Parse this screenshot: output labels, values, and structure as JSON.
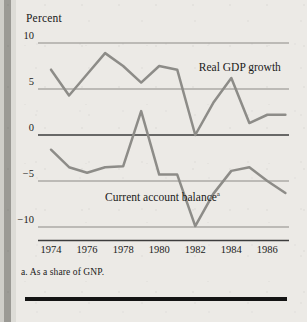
{
  "page": {
    "axis_unit_label": "Percent",
    "footnote": "a. As a share of GNP.",
    "bottom_rule_name": "bottom-rule"
  },
  "colors": {
    "background": "#eceae6",
    "gutter": "#9b9a95",
    "gridline": "#8b8a86",
    "zero_line": "#3c3c3c",
    "gdp_line": "#8d8c88",
    "current_account_line": "#8d8c88",
    "text": "#1a1a1a",
    "rule": "#141414"
  },
  "labels": {
    "gdp": "Real GDP growth",
    "current_account": "Current account balance",
    "current_account_superscript": "a"
  },
  "chart_data": {
    "type": "line",
    "title": "",
    "subtitle": "",
    "xlabel": "",
    "ylabel": "Percent",
    "ylim": [
      -10,
      10
    ],
    "xlim": [
      1973.5,
      1987.2
    ],
    "grid": true,
    "gridlines_y": [
      10,
      5,
      0,
      -5,
      -10
    ],
    "zero_line": 0,
    "legend_position": "inline-annotation",
    "ytick_labels": [
      "10",
      "5",
      "0",
      "−5",
      "−10"
    ],
    "ytick_values": [
      10,
      5,
      0,
      -5,
      -10
    ],
    "xtick_labels": [
      "1974",
      "1976",
      "1978",
      "1980",
      "1982",
      "1984",
      "1986"
    ],
    "xtick_values": [
      1974,
      1976,
      1978,
      1980,
      1982,
      1984,
      1986
    ],
    "x": [
      1974,
      1975,
      1976,
      1977,
      1978,
      1979,
      1980,
      1981,
      1982,
      1983,
      1984,
      1985,
      1986,
      1987
    ],
    "series": [
      {
        "name": "Real GDP growth",
        "color": "#8d8c88",
        "values": [
          7.1,
          4.3,
          6.6,
          8.9,
          7.5,
          5.7,
          7.5,
          7.1,
          0.0,
          3.5,
          6.2,
          1.3,
          2.2,
          2.2
        ]
      },
      {
        "name": "Current account balance",
        "color": "#8d8c88",
        "note": "a. As a share of GNP.",
        "values": [
          -1.6,
          -3.5,
          -4.1,
          -3.5,
          -3.4,
          2.6,
          -4.3,
          -4.3,
          -9.9,
          -6.4,
          -3.9,
          -3.5,
          -5.0,
          -6.3
        ]
      }
    ],
    "annotations": [
      {
        "text": "Real GDP growth",
        "x": 1982.2,
        "y": 7.2
      },
      {
        "text": "Current account balanceᵃ",
        "x": 1977.0,
        "y": -6.9
      }
    ]
  }
}
